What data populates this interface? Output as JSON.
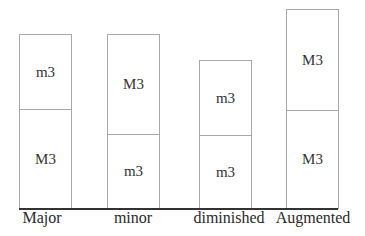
{
  "diagram": {
    "triads": [
      {
        "name": "Major",
        "lower": "M3",
        "upper": "m3"
      },
      {
        "name": "minor",
        "lower": "m3",
        "upper": "M3"
      },
      {
        "name": "diminished",
        "lower": "m3",
        "upper": "m3"
      },
      {
        "name": "Augmented",
        "lower": "M3",
        "upper": "M3"
      }
    ]
  }
}
